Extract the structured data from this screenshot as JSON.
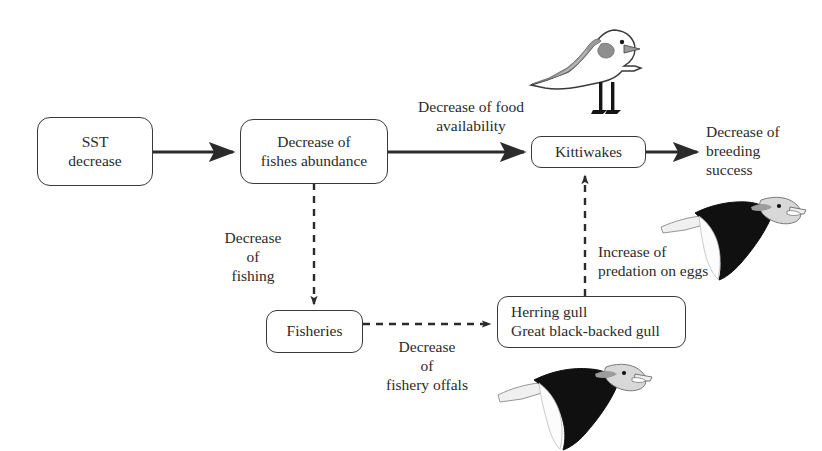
{
  "diagram": {
    "background_color": "#ffffff",
    "line_color": "#2b2b2b",
    "nodes": [
      {
        "id": "sst",
        "label": "SST\ndecrease",
        "line1": "SST",
        "line2": "decrease"
      },
      {
        "id": "fish",
        "label": "Decrease of\nfishes abundance",
        "line1": "Decrease of",
        "line2": "fishes abundance"
      },
      {
        "id": "kittiwakes",
        "label": "Kittiwakes",
        "line1": "Kittiwakes",
        "line2": ""
      },
      {
        "id": "fisheries",
        "label": "Fisheries",
        "line1": "Fisheries",
        "line2": ""
      },
      {
        "id": "gulls",
        "label": "Herring gull\nGreat black-backed gull",
        "line1": "Herring gull",
        "line2": "Great black-backed gull"
      }
    ],
    "edge_labels": [
      {
        "id": "food-availability",
        "line1": "Decrease of food",
        "line2": "availability",
        "line3": ""
      },
      {
        "id": "breeding-success",
        "line1": "Decrease of",
        "line2": "breeding",
        "line3": "success"
      },
      {
        "id": "decrease-fishing",
        "line1": "Decrease",
        "line2": "of",
        "line3": "fishing"
      },
      {
        "id": "fishery-offals",
        "line1": "Decrease",
        "line2": "of",
        "line3": "fishery offals"
      },
      {
        "id": "predation-eggs",
        "line1": "Increase of",
        "line2": "predation on eggs",
        "line3": ""
      }
    ],
    "edges": [
      {
        "id": "sst-to-fish",
        "style": "solid",
        "from": "sst",
        "to": "fish"
      },
      {
        "id": "fish-to-kittiwakes",
        "style": "solid",
        "from": "fish",
        "to": "kittiwakes"
      },
      {
        "id": "kittiwakes-to-breeding",
        "style": "solid",
        "from": "kittiwakes",
        "to": "breeding-success"
      },
      {
        "id": "fish-to-fisheries",
        "style": "dashed",
        "from": "fish",
        "to": "fisheries"
      },
      {
        "id": "fisheries-to-gulls",
        "style": "dashed",
        "from": "fisheries",
        "to": "gulls"
      },
      {
        "id": "gulls-to-kittiwakes",
        "style": "dashed",
        "from": "gulls",
        "to": "kittiwakes"
      }
    ],
    "illustrations": [
      {
        "id": "standing-kittiwake",
        "name": "kittiwake-standing-illustration"
      },
      {
        "id": "flying-gull-right",
        "name": "great-black-backed-gull-flying-illustration"
      },
      {
        "id": "flying-gull-bottom",
        "name": "great-black-backed-gull-flying-illustration"
      }
    ]
  }
}
